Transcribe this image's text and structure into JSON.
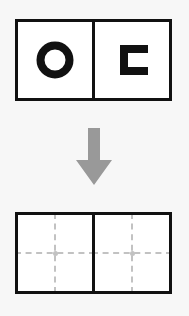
{
  "diagram": {
    "background_color": "#f7f7f7",
    "outline_color": "#111111",
    "glyph_color": "#111111",
    "guide_color": "#c2c2c2",
    "arrow_color": "#999999"
  },
  "top_panel": {
    "name": "input-shapes-panel",
    "cells": [
      {
        "name": "cell-left",
        "glyph_name": "ring-o-shape",
        "glyph_label": "O",
        "description": "thick black ring (letter O)"
      },
      {
        "name": "cell-right",
        "glyph_name": "square-bracket-c-shape",
        "glyph_label": "⊏",
        "description": "square C bracket opening to the right"
      }
    ]
  },
  "arrow": {
    "name": "down-arrow",
    "direction": "down",
    "color": "#999999"
  },
  "bottom_panel": {
    "name": "centerlines-panel",
    "cells": [
      {
        "name": "cell-left",
        "guides": [
          "vertical-dashed-guide",
          "horizontal-dashed-guide"
        ],
        "center_marker": "center-dot"
      },
      {
        "name": "cell-right",
        "guides": [
          "vertical-dashed-guide",
          "horizontal-dashed-guide"
        ],
        "center_marker": "center-dot"
      }
    ]
  }
}
